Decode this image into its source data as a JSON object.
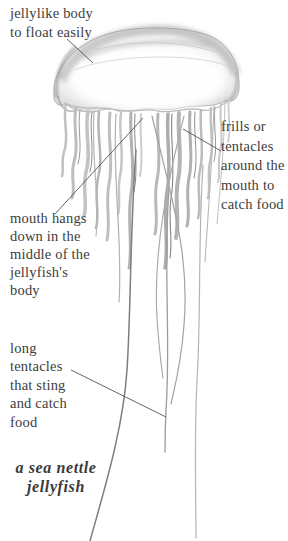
{
  "page": {
    "background": "#ffffff"
  },
  "colors": {
    "label_text": "#3d3d3d",
    "caption_text": "#3a3a3a",
    "leader_line": "#4a4a4a",
    "sketch_dark": "#8c8c8c",
    "sketch_light": "#c6c6c6"
  },
  "labels": {
    "jellylike_body": {
      "lines": [
        "jellylike body",
        "to float easily"
      ]
    },
    "frills": {
      "lines": [
        "frills or",
        "tentacles",
        "around the",
        "mouth to",
        "catch food"
      ]
    },
    "mouth": {
      "lines": [
        "mouth hangs",
        "down in the",
        "middle of the",
        "jellyfish's",
        "body"
      ]
    },
    "long_tentacles": {
      "lines": [
        "long",
        "tentacles",
        "that sting",
        "and catch",
        "food"
      ]
    }
  },
  "caption": {
    "lines": [
      "a sea nettle",
      "jellyfish"
    ]
  },
  "illustration": {
    "description": "soft pencil drawing of a sea nettle jellyfish: translucent bell, frilled oral arms around the mouth, and long trailing tentacles"
  }
}
